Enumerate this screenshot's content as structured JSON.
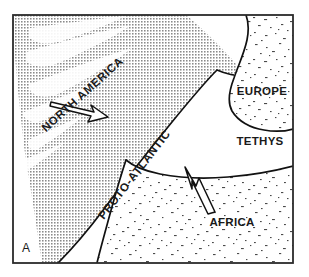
{
  "figure": {
    "panel_label": "A",
    "frame_color": "#2b2b2b",
    "background_color": "#ffffff",
    "line_color": "#111111"
  },
  "regions": [
    {
      "id": "north-america",
      "label": "NORTH AMERICA",
      "fill_pattern": "dense-halftone-dots",
      "fill_color": "#8a8a8a",
      "label_rotation_deg": -42
    },
    {
      "id": "europe",
      "label": "EUROPE",
      "fill_pattern": "sparse-stipple",
      "fill_color": "#555555",
      "label_rotation_deg": 0
    },
    {
      "id": "africa",
      "label": "AFRICA",
      "fill_pattern": "sparse-stipple",
      "fill_color": "#555555",
      "label_rotation_deg": 0
    }
  ],
  "oceans": [
    {
      "id": "proto-atlantic",
      "label": "PROTO-ATLANTIC",
      "fill_pattern": "none",
      "label_rotation_deg": -52
    },
    {
      "id": "tethys",
      "label": "TETHYS",
      "fill_pattern": "none",
      "label_rotation_deg": 0
    }
  ],
  "arrows": [
    {
      "id": "north-america-drift-arrow",
      "direction": "east-southeast",
      "style": "outlined-hollow"
    },
    {
      "id": "africa-drift-arrow",
      "direction": "north-northwest",
      "style": "outlined-hollow"
    }
  ]
}
